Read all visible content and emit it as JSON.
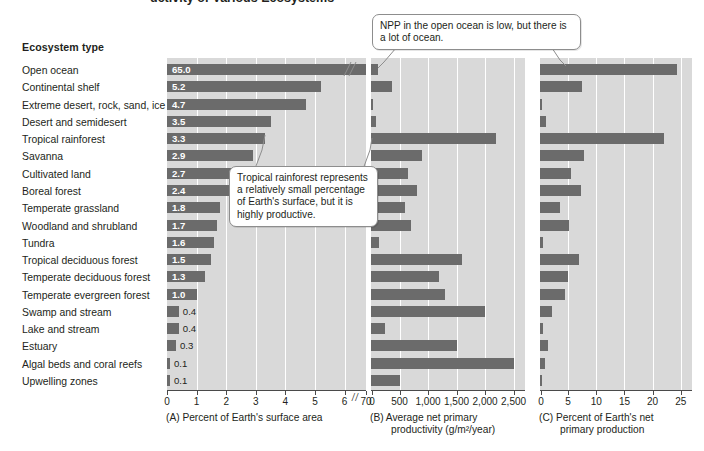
{
  "figure": {
    "cut_title": "uctivity of Various Ecosystems",
    "labels_header": "Ecosystem type"
  },
  "ecosystems": [
    "Open ocean",
    "Continental shelf",
    "Extreme desert, rock, sand, ice",
    "Desert and semidesert",
    "Tropical rainforest",
    "Savanna",
    "Cultivated land",
    "Boreal forest",
    "Temperate grassland",
    "Woodland and shrubland",
    "Tundra",
    "Tropical deciduous forest",
    "Temperate deciduous forest",
    "Temperate evergreen forest",
    "Swamp and stream",
    "Lake and stream",
    "Estuary",
    "Algal beds and coral reefs",
    "Upwelling zones"
  ],
  "panels": {
    "a": {
      "letter": "(A)",
      "caption": "Percent of Earth's surface area",
      "ticks": [
        "0",
        "1",
        "2",
        "3",
        "4",
        "5",
        "6",
        "70"
      ],
      "tick_values": [
        0,
        1,
        2,
        3,
        4,
        5,
        6,
        70
      ],
      "broken_axis": true,
      "break_after": 6,
      "labels": [
        "65.0",
        "5.2",
        "4.7",
        "3.5",
        "3.3",
        "2.9",
        "2.7",
        "2.4",
        "1.8",
        "1.7",
        "1.6",
        "1.5",
        "1.3",
        "1.0",
        "0.4",
        "0.4",
        "0.3",
        "0.1",
        "0.1"
      ]
    },
    "b": {
      "letter": "(B)",
      "caption_line1": "Average net primary",
      "caption_line2": "productivity (g/m²/year)",
      "ticks": [
        "0",
        "500",
        "1,000",
        "1,500",
        "2,000",
        "2,500"
      ],
      "tick_values": [
        0,
        500,
        1000,
        1500,
        2000,
        2500
      ]
    },
    "c": {
      "letter": "(C)",
      "caption_line1": "Percent of Earth's net",
      "caption_line2": "primary production",
      "ticks": [
        "0",
        "5",
        "10",
        "15",
        "20",
        "25"
      ],
      "tick_values": [
        0,
        5,
        10,
        15,
        20,
        25
      ]
    }
  },
  "callouts": {
    "npp_ocean": "NPP in the open ocean is low, but there is a lot of ocean.",
    "rainforest": "Tropical rainforest represents a relatively small percentage of Earth's surface, but it is highly productive."
  },
  "colors": {
    "bar": "#6b6b6b",
    "panel_bg": "#d9d9d9",
    "gridline": "#ffffff",
    "axis": "#4a4a4a",
    "text": "#231f20",
    "callout_border": "#8d8d8d"
  },
  "chart_data": {
    "type": "bar",
    "orientation": "horizontal",
    "grid": true,
    "legend": "none",
    "categories": [
      "Open ocean",
      "Continental shelf",
      "Extreme desert, rock, sand, ice",
      "Desert and semidesert",
      "Tropical rainforest",
      "Savanna",
      "Cultivated land",
      "Boreal forest",
      "Temperate grassland",
      "Woodland and shrubland",
      "Tundra",
      "Tropical deciduous forest",
      "Temperate deciduous forest",
      "Temperate evergreen forest",
      "Swamp and stream",
      "Lake and stream",
      "Estuary",
      "Algal beds and coral reefs",
      "Upwelling zones"
    ],
    "ylabel": "Ecosystem type",
    "panels": [
      {
        "key": "a",
        "label": "(A) Percent of Earth's surface area",
        "xlabel": "Percent of Earth's surface area",
        "xlim": [
          0,
          70
        ],
        "axis_break": {
          "from": 6,
          "to": 70
        },
        "xticks": [
          0,
          1,
          2,
          3,
          4,
          5,
          6,
          70
        ],
        "data_labels": true,
        "values": [
          65.0,
          5.2,
          4.7,
          3.5,
          3.3,
          2.9,
          2.7,
          2.4,
          1.8,
          1.7,
          1.6,
          1.5,
          1.3,
          1.0,
          0.4,
          0.4,
          0.3,
          0.1,
          0.1
        ]
      },
      {
        "key": "b",
        "label": "(B) Average net primary productivity (g/m²/year)",
        "xlabel": "Average net primary productivity (g/m²/year)",
        "xlim": [
          0,
          2700
        ],
        "xticks": [
          0,
          500,
          1000,
          1500,
          2000,
          2500
        ],
        "data_labels": false,
        "values": [
          125,
          360,
          3,
          90,
          2200,
          900,
          650,
          800,
          600,
          700,
          140,
          1600,
          1200,
          1300,
          2000,
          250,
          1500,
          2500,
          500
        ]
      },
      {
        "key": "c",
        "label": "(C) Percent of Earth's net primary production",
        "xlabel": "Percent of Earth's net primary production",
        "xlim": [
          0,
          27
        ],
        "xticks": [
          0,
          5,
          10,
          15,
          20,
          25
        ],
        "data_labels": false,
        "values": [
          24.4,
          7.5,
          0.04,
          1.0,
          22.0,
          7.8,
          5.5,
          7.2,
          3.6,
          5.2,
          0.6,
          7.0,
          5.0,
          4.5,
          2.2,
          0.5,
          1.4,
          0.9,
          0.2
        ]
      }
    ],
    "annotations": [
      {
        "text": "NPP in the open ocean is low, but there is a lot of ocean.",
        "targets": [
          "panel B: Open ocean",
          "panel C: Open ocean"
        ]
      },
      {
        "text": "Tropical rainforest represents a relatively small percentage of Earth's surface, but it is highly productive.",
        "targets": [
          "panel A: Tropical rainforest",
          "panel B: Tropical rainforest"
        ]
      }
    ]
  }
}
